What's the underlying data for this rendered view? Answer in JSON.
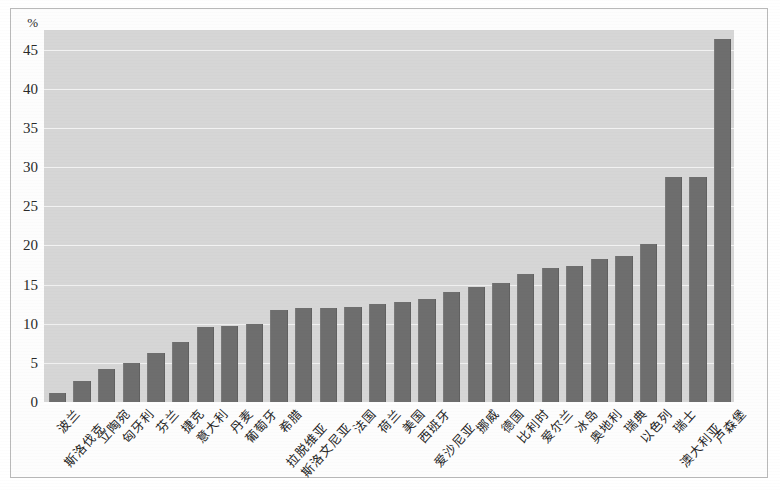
{
  "chart_data": {
    "type": "bar",
    "title": "",
    "subtitle": "",
    "xlabel": "",
    "ylabel": "",
    "unit_label": "%",
    "ylim": [
      0,
      47.5
    ],
    "ytick_labels": [
      "0",
      "5",
      "10",
      "15",
      "20",
      "25",
      "30",
      "35",
      "40",
      "45"
    ],
    "yticks": [
      0,
      5,
      10,
      15,
      20,
      25,
      30,
      35,
      40,
      45
    ],
    "grid": true,
    "legend": "none",
    "orientation": "vertical",
    "sorted": "ascending",
    "bar_color": "#6e6e6e",
    "plot_background": "#d6d6d6",
    "gridline_color": "#f2f2f2",
    "categories": [
      "波兰",
      "斯洛伐克",
      "立陶宛",
      "匈牙利",
      "芬兰",
      "捷克",
      "意大利",
      "丹麦",
      "葡萄牙",
      "希腊",
      "拉脱维亚",
      "斯洛文尼亚",
      "法国",
      "荷兰",
      "美国",
      "西班牙",
      "爱沙尼亚",
      "挪威",
      "德国",
      "比利时",
      "爱尔兰",
      "冰岛",
      "奥地利",
      "瑞典",
      "以色列",
      "瑞士",
      "澳大利亚",
      "卢森堡"
    ],
    "values": [
      1.2,
      2.7,
      4.2,
      5.0,
      6.3,
      7.6,
      9.6,
      9.7,
      10.0,
      11.8,
      12.0,
      12.0,
      12.1,
      12.5,
      12.8,
      13.1,
      14.1,
      14.7,
      15.2,
      16.4,
      17.1,
      17.4,
      18.3,
      18.6,
      20.2,
      28.7,
      28.7,
      46.4
    ]
  }
}
